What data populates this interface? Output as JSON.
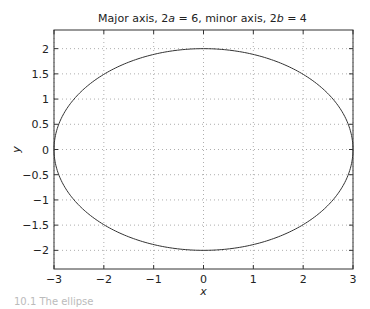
{
  "chart_data": {
    "type": "line",
    "title": "Major axis, 2a = 6, minor axis, 2b = 4",
    "title_parts": [
      "Major axis, 2",
      "a",
      " = 6, minor axis, 2",
      "b",
      " = 4"
    ],
    "xlabel": "x",
    "ylabel": "y",
    "xlim": [
      -3,
      3
    ],
    "ylim": [
      -2.37,
      2.37
    ],
    "xticks": [
      -3,
      -2,
      -1,
      0,
      1,
      2,
      3
    ],
    "xtick_labels": [
      "−3",
      "−2",
      "−1",
      "0",
      "1",
      "2",
      "3"
    ],
    "yticks": [
      -2,
      -1.5,
      -1,
      -0.5,
      0,
      0.5,
      1,
      1.5,
      2
    ],
    "ytick_labels": [
      "−2",
      "−1.5",
      "−1",
      "−0.5",
      "0",
      "0.5",
      "1",
      "1.5",
      "2"
    ],
    "grid": true,
    "grid_style": "dotted",
    "legend": null,
    "series": [
      {
        "name": "ellipse",
        "equation": "x^2/9 + y^2/4 = 1",
        "a": 3,
        "b": 2,
        "center": [
          0,
          0
        ],
        "color": "#333333"
      }
    ]
  },
  "caption": "10.1 The ellipse"
}
